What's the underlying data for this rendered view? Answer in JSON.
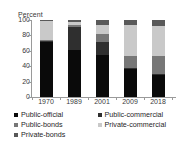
{
  "chart_data": {
    "type": "bar",
    "variant": "stacked-100",
    "title": "",
    "xlabel": "",
    "ylabel": "Percent",
    "ylim": [
      0,
      100
    ],
    "yticks": [
      100,
      80,
      60,
      40,
      20,
      0
    ],
    "grid": false,
    "legend_position": "bottom",
    "categories": [
      "1970",
      "1989",
      "2001",
      "2009",
      "2018"
    ],
    "series": [
      {
        "name": "Public-official",
        "color": "#0a0a0a",
        "values": [
          71,
          61,
          54,
          36,
          28
        ]
      },
      {
        "name": "Public-commercial",
        "color": "#2f2f2f",
        "values": [
          2,
          30,
          18,
          2,
          2
        ]
      },
      {
        "name": "Public-bonds",
        "color": "#777777",
        "values": [
          1,
          3,
          10,
          15,
          23
        ]
      },
      {
        "name": "Private-commercial",
        "color": "#c9c9c9",
        "values": [
          25,
          3,
          12,
          41,
          39
        ]
      },
      {
        "name": "Private-bonds",
        "color": "#595959",
        "values": [
          1,
          3,
          6,
          6,
          8
        ]
      }
    ]
  },
  "axis": {
    "y_title": "Percent"
  }
}
